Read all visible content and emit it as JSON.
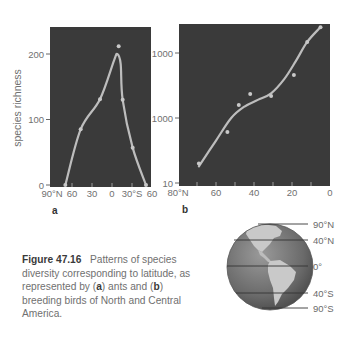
{
  "chart_data": [
    {
      "type": "line",
      "panel": "a",
      "title": "",
      "xlabel": "",
      "ylabel": "species richness",
      "x_range": [
        -90,
        60
      ],
      "x_ticks": [
        -90,
        -60,
        -30,
        0,
        30,
        60
      ],
      "x_tick_labels": [
        "90°N",
        "60",
        "30",
        "0",
        "30°S",
        "60"
      ],
      "ylim": [
        0,
        240
      ],
      "y_ticks": [
        0,
        100,
        200
      ],
      "y_tick_labels": [
        "0",
        "100",
        "200"
      ],
      "grid": false,
      "points": {
        "x": [
          -70,
          -47,
          -18,
          10,
          16,
          31,
          51
        ],
        "y": [
          0,
          85,
          131,
          212,
          130,
          57,
          0
        ]
      },
      "curve": {
        "x": [
          -70,
          -47,
          -18,
          3,
          8,
          13,
          16,
          31,
          51
        ],
        "y": [
          0,
          85,
          131,
          190,
          200,
          185,
          130,
          57,
          0
        ]
      }
    },
    {
      "type": "line",
      "panel": "b",
      "title": "",
      "xlabel": "",
      "ylabel": "",
      "y_scale": "log",
      "x_range": [
        80,
        0
      ],
      "x_ticks": [
        80,
        60,
        40,
        20,
        0
      ],
      "x_tick_labels": [
        "80°N",
        "60",
        "40",
        "20",
        "0"
      ],
      "ylim": [
        10,
        3000
      ],
      "y_ticks": [
        10,
        100,
        1000
      ],
      "y_tick_labels": [
        "10",
        "1000",
        "1000"
      ],
      "grid": false,
      "points": {
        "x": [
          69,
          54,
          48,
          42,
          31,
          19,
          12,
          5
        ],
        "y": [
          20,
          61,
          158,
          234,
          218,
          460,
          1480,
          2500
        ]
      },
      "curve": {
        "x": [
          69,
          60,
          52,
          45,
          38,
          31,
          24,
          18,
          12,
          5
        ],
        "y": [
          18,
          45,
          100,
          150,
          190,
          240,
          400,
          750,
          1480,
          2500
        ]
      }
    }
  ],
  "panel_labels": {
    "a": "a",
    "b": "b"
  },
  "caption": {
    "figure_number": "Figure 47.16",
    "text_parts": [
      {
        "t": "Patterns of species diversity corresponding to latitude, as represented by (",
        "b": false
      },
      {
        "t": "a",
        "b": true
      },
      {
        "t": ") ants and (",
        "b": false
      },
      {
        "t": "b",
        "b": true
      },
      {
        "t": ") breeding birds of North and Central America.",
        "b": false
      }
    ]
  },
  "globe": {
    "labels": [
      "90°N",
      "40°N",
      "0°",
      "40°S",
      "90°S"
    ]
  },
  "colors": {
    "plot_bg": "#3a3a3a",
    "curve": "#bdbdbd",
    "point": "#c8c8c8",
    "globe_ocean": "#6e6e6e",
    "globe_land": "#c9c9c9"
  }
}
